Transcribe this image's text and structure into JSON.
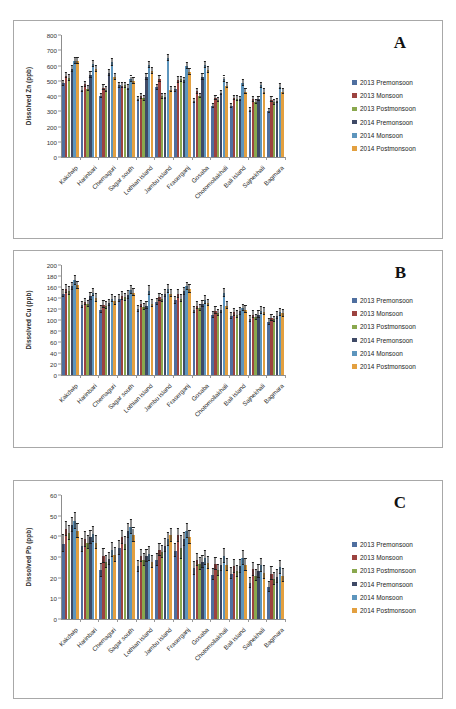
{
  "figure": {
    "caption_fragment": "",
    "panels": [
      "A",
      "B",
      "C"
    ]
  },
  "legend": {
    "position": "right",
    "entries": [
      {
        "label": "2013 Premonsoon",
        "color": "#4f6f9f"
      },
      {
        "label": "2013 Monsoon",
        "color": "#9c4340"
      },
      {
        "label": "2013 Postmonsoon",
        "color": "#8aa84e"
      },
      {
        "label": "2014 Premonsoon",
        "color": "#3f4a66"
      },
      {
        "label": "2014 Monsoon",
        "color": "#5d95bd"
      },
      {
        "label": "2014 Postmonsoon",
        "color": "#e3a040"
      }
    ]
  },
  "chart_data": [
    {
      "panel": "A",
      "type": "bar",
      "title": "",
      "xlabel": "",
      "ylabel": "Dissolved Zn (ppb)",
      "ylim": [
        0,
        800
      ],
      "yticks": [
        0,
        100,
        200,
        300,
        400,
        500,
        600,
        700,
        800
      ],
      "grid": false,
      "legend_position": "right",
      "categories": [
        "Kakdwip",
        "Harinbari",
        "Chemaguri",
        "Sagar south",
        "Lothian island",
        "Jambu island",
        "Fraserganj",
        "Gosaba",
        "Chotomollakhali",
        "Bali island",
        "Sajnekhali",
        "Bagmara"
      ],
      "series": [
        {
          "name": "2013 Premonsoon",
          "color": "#4f6f9f",
          "values": [
            483,
            441,
            400,
            470,
            380,
            456,
            443,
            367,
            337,
            334,
            307,
            302
          ],
          "error": [
            18,
            16,
            15,
            17,
            14,
            17,
            16,
            14,
            13,
            13,
            12,
            12
          ]
        },
        {
          "name": "2013 Monsoon",
          "color": "#9c4340",
          "values": [
            534,
            478,
            455,
            467,
            397,
            512,
            506,
            430,
            386,
            387,
            378,
            377
          ],
          "error": [
            19,
            17,
            17,
            17,
            15,
            18,
            18,
            16,
            15,
            15,
            14,
            14
          ]
        },
        {
          "name": "2013 Postmonsoon",
          "color": "#8aa84e",
          "values": [
            520,
            447,
            440,
            470,
            385,
            397,
            509,
            400,
            373,
            383,
            362,
            358
          ],
          "error": [
            19,
            17,
            16,
            17,
            15,
            15,
            18,
            15,
            14,
            14,
            14,
            14
          ]
        },
        {
          "name": "2014 Premonsoon",
          "color": "#3f4a66",
          "values": [
            575,
            537,
            551,
            455,
            525,
            396,
            503,
            526,
            420,
            380,
            382,
            367
          ],
          "error": [
            20,
            19,
            20,
            17,
            19,
            15,
            18,
            19,
            16,
            14,
            14,
            14
          ]
        },
        {
          "name": "2014 Monsoon",
          "color": "#5d95bd",
          "values": [
            632,
            612,
            620,
            510,
            605,
            650,
            595,
            605,
            510,
            485,
            470,
            462
          ],
          "error": [
            20,
            19,
            20,
            18,
            19,
            22,
            19,
            20,
            18,
            17,
            17,
            17
          ]
        },
        {
          "name": "2014 Postmonsoon",
          "color": "#e3a040",
          "values": [
            627,
            575,
            525,
            500,
            565,
            440,
            557,
            570,
            468,
            427,
            427,
            428
          ],
          "error": [
            20,
            19,
            18,
            18,
            19,
            16,
            19,
            19,
            17,
            16,
            16,
            16
          ]
        }
      ]
    },
    {
      "panel": "B",
      "type": "bar",
      "title": "",
      "xlabel": "",
      "ylabel": "Dissolved Cu (ppb)",
      "ylim": [
        0,
        200
      ],
      "yticks": [
        0,
        20,
        40,
        60,
        80,
        100,
        120,
        140,
        160,
        180,
        200
      ],
      "grid": false,
      "legend_position": "right",
      "categories": [
        "Kakdwip",
        "Harinbari",
        "Chemaguri",
        "Sagar south",
        "Lothian island",
        "Jambu island",
        "Fraserganj",
        "Gosaba",
        "Chotomollakhali",
        "Bali island",
        "Sajnekhali",
        "Bagmara"
      ],
      "series": [
        {
          "name": "2013 Premonsoon",
          "color": "#4f6f9f",
          "values": [
            148,
            127,
            119,
            139,
            120,
            133,
            136,
            118,
            109,
            107,
            102,
            96
          ],
          "error": [
            7,
            6,
            6,
            6,
            6,
            6,
            6,
            6,
            6,
            6,
            5,
            5
          ]
        },
        {
          "name": "2013 Monsoon",
          "color": "#9c4340",
          "values": [
            156,
            133,
            128,
            144,
            129,
            141,
            147,
            126,
            117,
            114,
            110,
            104
          ],
          "error": [
            7,
            6,
            6,
            7,
            6,
            6,
            7,
            6,
            6,
            6,
            6,
            5
          ]
        },
        {
          "name": "2013 Postmonsoon",
          "color": "#8aa84e",
          "values": [
            153,
            129,
            126,
            141,
            124,
            139,
            139,
            122,
            113,
            110,
            105,
            101
          ],
          "error": [
            7,
            6,
            6,
            6,
            6,
            6,
            6,
            6,
            6,
            6,
            5,
            5
          ]
        },
        {
          "name": "2014 Premonsoon",
          "color": "#3f4a66",
          "values": [
            161,
            143,
            131,
            146,
            126,
            148,
            152,
            129,
            119,
            116,
            110,
            108
          ],
          "error": [
            7,
            7,
            6,
            7,
            6,
            7,
            7,
            6,
            6,
            6,
            6,
            6
          ]
        },
        {
          "name": "2014 Monsoon",
          "color": "#5d95bd",
          "values": [
            172,
            150,
            139,
            155,
            153,
            156,
            161,
            137,
            149,
            122,
            117,
            114
          ],
          "error": [
            8,
            7,
            7,
            7,
            8,
            7,
            7,
            7,
            8,
            6,
            6,
            6
          ]
        },
        {
          "name": "2014 Postmonsoon",
          "color": "#e3a040",
          "values": [
            163,
            140,
            135,
            150,
            130,
            148,
            156,
            131,
            126,
            119,
            115,
            112
          ],
          "error": [
            7,
            7,
            7,
            7,
            6,
            7,
            7,
            6,
            6,
            6,
            6,
            6
          ]
        }
      ]
    },
    {
      "panel": "C",
      "type": "bar",
      "title": "",
      "xlabel": "",
      "ylabel": "Dissolved Pb (ppb)",
      "ylim": [
        0,
        60
      ],
      "yticks": [
        0,
        10,
        20,
        30,
        40,
        50,
        60
      ],
      "grid": false,
      "legend_position": "right",
      "categories": [
        "Kakdwip",
        "Harinbari",
        "Chemaguri",
        "Sagar south",
        "Lothian island",
        "Jambu island",
        "Fraserganj",
        "Gosaba",
        "Chotomollakhali",
        "Bali island",
        "Sajnekhali",
        "Bagmara"
      ],
      "series": [
        {
          "name": "2013 Premonsoon",
          "color": "#4f6f9f",
          "values": [
            36.5,
            35.5,
            23.5,
            34.5,
            25.5,
            28.5,
            33.0,
            24.5,
            21.5,
            22.0,
            17.5,
            15.5
          ],
          "error": [
            4.0,
            3.3,
            3.2,
            3.3,
            2.6,
            2.8,
            3.2,
            3.0,
            2.6,
            2.8,
            2.5,
            2.5
          ]
        },
        {
          "name": "2013 Monsoon",
          "color": "#9c4340",
          "values": [
            43.5,
            38.5,
            30.5,
            39.5,
            30.5,
            33.5,
            40.5,
            28.5,
            26.5,
            25.5,
            24.0,
            22.0
          ],
          "error": [
            3.5,
            3.5,
            3.2,
            3.2,
            3.0,
            3.0,
            3.2,
            3.0,
            3.0,
            3.0,
            3.0,
            3.0
          ]
        },
        {
          "name": "2013 Postmonsoon",
          "color": "#8aa84e",
          "values": [
            41.5,
            37.0,
            27.5,
            36.5,
            28.5,
            32.5,
            34.5,
            26.5,
            23.5,
            23.0,
            21.0,
            19.5
          ],
          "error": [
            3.5,
            3.3,
            3.0,
            3.2,
            3.0,
            3.0,
            5.5,
            3.0,
            2.8,
            2.8,
            2.8,
            2.8
          ]
        },
        {
          "name": "2014 Premonsoon",
          "color": "#3f4a66",
          "values": [
            45.5,
            39.5,
            29.0,
            42.5,
            30.5,
            35.5,
            38.5,
            27.5,
            26.0,
            25.5,
            23.0,
            20.5
          ],
          "error": [
            3.5,
            3.3,
            3.0,
            3.3,
            3.0,
            3.2,
            3.3,
            3.0,
            3.0,
            3.0,
            3.0,
            3.0
          ]
        },
        {
          "name": "2014 Monsoon",
          "color": "#5d95bd",
          "values": [
            47.5,
            41.0,
            33.5,
            44.5,
            31.5,
            38.5,
            42.5,
            29.5,
            30.5,
            29.5,
            26.0,
            25.0
          ],
          "error": [
            3.8,
            3.5,
            3.3,
            3.5,
            3.2,
            3.3,
            3.5,
            3.2,
            3.2,
            3.2,
            3.2,
            3.2
          ]
        },
        {
          "name": "2014 Postmonsoon",
          "color": "#e3a040",
          "values": [
            42.5,
            37.0,
            31.0,
            40.5,
            27.5,
            40.5,
            39.5,
            27.0,
            26.0,
            26.0,
            22.5,
            21.0
          ],
          "error": [
            3.5,
            3.3,
            3.2,
            3.3,
            3.0,
            3.2,
            3.3,
            3.0,
            3.0,
            3.0,
            3.0,
            3.0
          ]
        }
      ]
    }
  ]
}
